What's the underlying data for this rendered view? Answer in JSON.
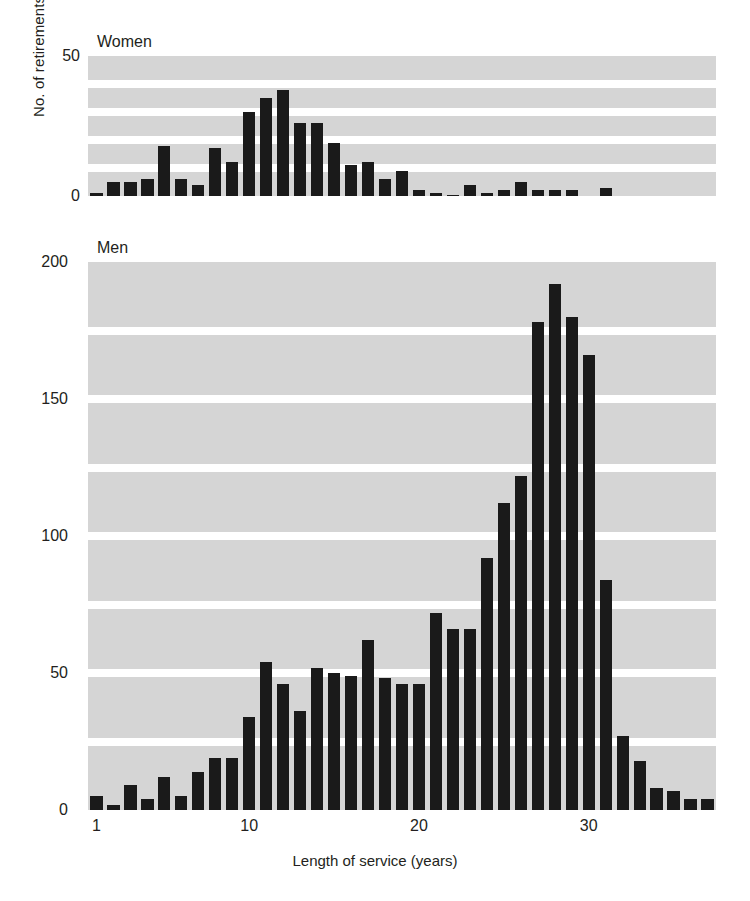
{
  "chart_data": [
    {
      "type": "bar",
      "title": "Women",
      "xlabel": "Length of service (years)",
      "ylabel": "No. of retirements",
      "ylim": [
        0,
        50
      ],
      "yticks": [
        0,
        50
      ],
      "xlim": [
        0.5,
        37.5
      ],
      "xticks": [
        1,
        10,
        20,
        30
      ],
      "grid": "horizontal-banded",
      "bar_color": "#1a1a1a",
      "panel_color": "#d5d5d5",
      "x": [
        1,
        2,
        3,
        4,
        5,
        6,
        7,
        8,
        9,
        10,
        11,
        12,
        13,
        14,
        15,
        16,
        17,
        18,
        19,
        20,
        21,
        22,
        23,
        24,
        25,
        26,
        27,
        28,
        29,
        30,
        31,
        32,
        33
      ],
      "values": [
        1,
        5,
        5,
        6,
        18,
        6,
        4,
        17,
        12,
        30,
        35,
        38,
        26,
        26,
        19,
        11,
        12,
        6,
        9,
        2,
        1,
        0.5,
        4,
        1,
        2,
        5,
        2,
        2,
        2,
        0,
        3,
        0,
        0
      ]
    },
    {
      "type": "bar",
      "title": "Men",
      "xlabel": "Length of service (years)",
      "ylabel": "No. of retirements",
      "ylim": [
        0,
        200
      ],
      "yticks": [
        0,
        50,
        100,
        150,
        200
      ],
      "xlim": [
        0.5,
        37.5
      ],
      "xticks": [
        1,
        10,
        20,
        30
      ],
      "grid": "horizontal-banded",
      "bar_color": "#1a1a1a",
      "panel_color": "#d5d5d5",
      "x": [
        1,
        2,
        3,
        4,
        5,
        6,
        7,
        8,
        9,
        10,
        11,
        12,
        13,
        14,
        15,
        16,
        17,
        18,
        19,
        20,
        21,
        22,
        23,
        24,
        25,
        26,
        27,
        28,
        29,
        30,
        31,
        32,
        33,
        34,
        35,
        36,
        37
      ],
      "values": [
        5,
        2,
        9,
        4,
        12,
        5,
        14,
        19,
        19,
        34,
        54,
        46,
        36,
        52,
        50,
        49,
        62,
        48,
        46,
        46,
        72,
        66,
        66,
        92,
        112,
        122,
        178,
        192,
        180,
        166,
        84,
        27,
        18,
        8,
        7,
        4,
        4
      ]
    }
  ],
  "axis": {
    "y_label": "No. of retirements",
    "x_label": "Length of service (years)",
    "women_yticks": [
      "50",
      "0"
    ],
    "men_yticks": [
      "200",
      "150",
      "100",
      "50",
      "0"
    ],
    "xticks": [
      "1",
      "10",
      "20",
      "30"
    ]
  },
  "panels": {
    "women_title": "Women",
    "men_title": "Men"
  },
  "colors": {
    "panel": "#d5d5d5",
    "bar": "#1a1a1a",
    "background": "#ffffff",
    "text": "#231f20"
  }
}
